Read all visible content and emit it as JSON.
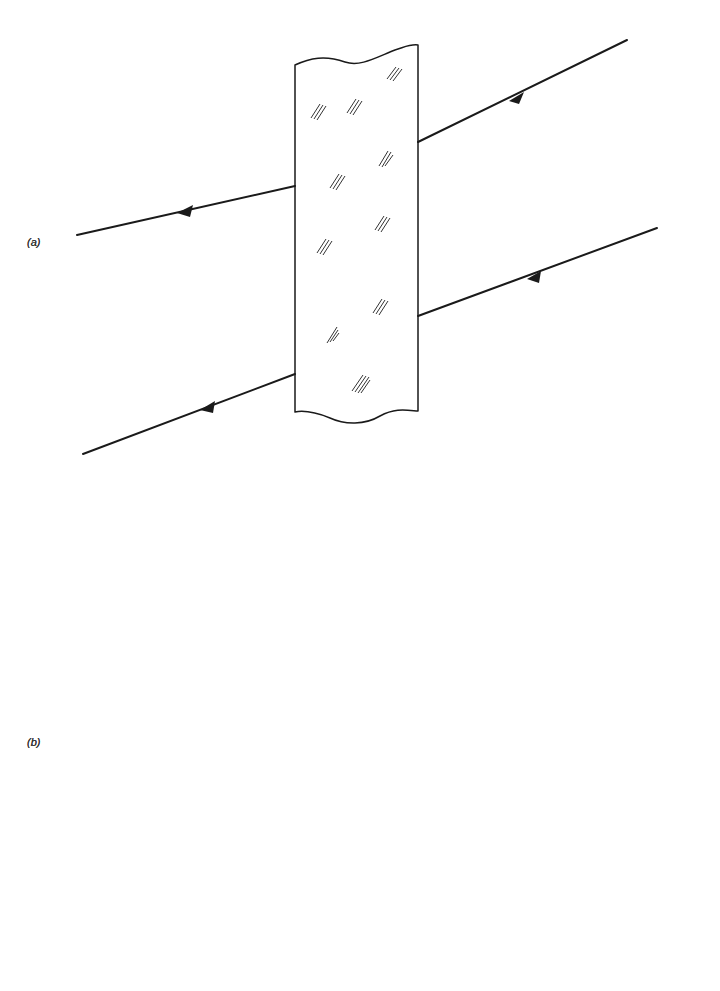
{
  "figure": {
    "panel_a": {
      "label": "(a)",
      "description": "Parallel-sided glass slab with two parallel rays passing through, each undeviated in direction"
    },
    "panel_b": {
      "label": "(b)",
      "description": "Glass piece with one curved (concave) face; upper ray exits horizontal, lower ray exits parallel"
    }
  }
}
